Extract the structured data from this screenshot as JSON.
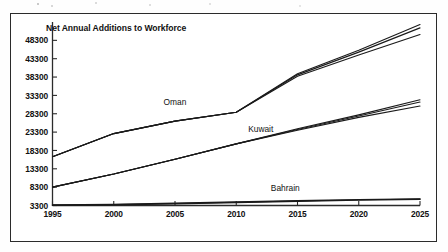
{
  "chart_data": {
    "type": "line",
    "title": "Net Annual Additions to Workforce",
    "xlabel": "",
    "ylabel": "",
    "x": [
      1995,
      2000,
      2005,
      2010,
      2015,
      2020,
      2025
    ],
    "xlim": [
      1995,
      2025
    ],
    "ylim": [
      3300,
      53300
    ],
    "xticks": [
      "1995",
      "2000",
      "2005",
      "2010",
      "2015",
      "2020",
      "2025"
    ],
    "yticks": [
      "3300",
      "8300",
      "13300",
      "18300",
      "23300",
      "28300",
      "33300",
      "38300",
      "43300",
      "48300"
    ],
    "ytick_values": [
      3300,
      8300,
      13300,
      18300,
      23300,
      28300,
      33300,
      38300,
      43300,
      48300
    ],
    "grid": false,
    "legend": "inline-labels",
    "line_color": "#1a1a1a",
    "series": [
      {
        "name": "Oman",
        "group": "Oman",
        "values": [
          16600,
          22900,
          26300,
          28700,
          39200,
          45600,
          52600
        ]
      },
      {
        "name": "Oman-variant-2",
        "group": "Oman",
        "values": [
          16600,
          22900,
          26300,
          28700,
          38900,
          45100,
          51700
        ]
      },
      {
        "name": "Oman-variant-3",
        "group": "Oman",
        "values": [
          16600,
          22900,
          26300,
          28700,
          38500,
          44300,
          49900
        ]
      },
      {
        "name": "Kuwait",
        "group": "Kuwait",
        "values": [
          8300,
          11900,
          15900,
          20100,
          24200,
          28000,
          32100
        ]
      },
      {
        "name": "Kuwait-variant-2",
        "group": "Kuwait",
        "values": [
          8300,
          11900,
          15900,
          20100,
          24000,
          27700,
          31500
        ]
      },
      {
        "name": "Kuwait-variant-3",
        "group": "Kuwait",
        "values": [
          8300,
          11900,
          15900,
          20100,
          23800,
          27300,
          30400
        ]
      },
      {
        "name": "Bahrain",
        "group": "Bahrain",
        "values": [
          3450,
          3600,
          3900,
          4250,
          4600,
          4900,
          5100
        ]
      },
      {
        "name": "Bahrain-variant-2",
        "group": "Bahrain",
        "values": [
          3400,
          3520,
          3780,
          4100,
          4450,
          4760,
          4980
        ]
      }
    ],
    "annotations": [
      {
        "text": "Oman",
        "x": 2005,
        "y": 30600
      },
      {
        "text": "Kuwait",
        "x": 2012,
        "y": 23400
      },
      {
        "text": "Bahrain",
        "x": 2014,
        "y": 7300
      }
    ]
  }
}
